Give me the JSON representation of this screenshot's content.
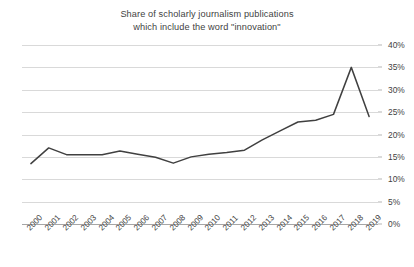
{
  "chart_data": {
    "type": "line",
    "title": "Share of scholarly journalism publications which include the word \"innovation\"",
    "title_lines": [
      "Share of scholarly journalism publications",
      "which include the word \"innovation\""
    ],
    "xlabel": "",
    "ylabel": "",
    "categories": [
      "2000",
      "2001",
      "2002",
      "2003",
      "2004",
      "2005",
      "2006",
      "2007",
      "2008",
      "2009",
      "2010",
      "2011",
      "2012",
      "2013",
      "2014",
      "2015",
      "2016",
      "2017",
      "2018",
      "2019"
    ],
    "values": [
      13.5,
      17.0,
      15.5,
      15.5,
      15.5,
      16.3,
      15.6,
      14.9,
      13.6,
      15.0,
      15.6,
      16.0,
      16.5,
      18.8,
      20.8,
      22.8,
      23.2,
      24.5,
      35.0,
      24.0
    ],
    "series": [
      {
        "name": "Share of publications including \"innovation\"",
        "color": "#404040",
        "values": [
          13.5,
          17.0,
          15.5,
          15.5,
          15.5,
          16.3,
          15.6,
          14.9,
          13.6,
          15.0,
          15.6,
          16.0,
          16.5,
          18.8,
          20.8,
          22.8,
          23.2,
          24.5,
          35.0,
          24.0
        ]
      }
    ],
    "ylim": [
      0,
      40
    ],
    "y_ticks": [
      0,
      5,
      10,
      15,
      20,
      25,
      30,
      35,
      40
    ],
    "y_tick_labels": [
      "0%",
      "5%",
      "10%",
      "15%",
      "20%",
      "25%",
      "30%",
      "35%",
      "40%"
    ],
    "y_tick_suffix": "%",
    "grid": true,
    "grid_axis": "y",
    "legend": false,
    "legend_position": "none",
    "x_label_rotation": -45,
    "colors": {
      "line": "#404040",
      "gridline": "#d9d9d9",
      "axis": "#a6a6a6",
      "text": "#3f3f3f",
      "background": "#ffffff"
    }
  }
}
